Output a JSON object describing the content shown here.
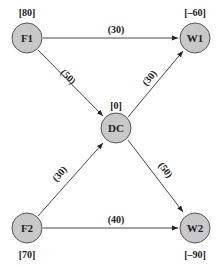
{
  "diagram": {
    "nodes": [
      {
        "id": "F1",
        "label": "F1",
        "value": "[80]",
        "x": 27,
        "y": 38
      },
      {
        "id": "W1",
        "label": "W1",
        "value": "[–60]",
        "x": 195,
        "y": 38
      },
      {
        "id": "DC",
        "label": "DC",
        "value": "[0]",
        "x": 116,
        "y": 128
      },
      {
        "id": "F2",
        "label": "F2",
        "value": "[70]",
        "x": 27,
        "y": 228
      },
      {
        "id": "W2",
        "label": "W2",
        "value": "[–90]",
        "x": 195,
        "y": 228
      }
    ],
    "edges": [
      {
        "from": "F1",
        "to": "W1",
        "cost": "(30)"
      },
      {
        "from": "F1",
        "to": "DC",
        "cost": "(50)"
      },
      {
        "from": "DC",
        "to": "W1",
        "cost": "(30)"
      },
      {
        "from": "F2",
        "to": "DC",
        "cost": "(30)"
      },
      {
        "from": "DC",
        "to": "W2",
        "cost": "(50)"
      },
      {
        "from": "F2",
        "to": "W2",
        "cost": "(40)"
      }
    ]
  }
}
